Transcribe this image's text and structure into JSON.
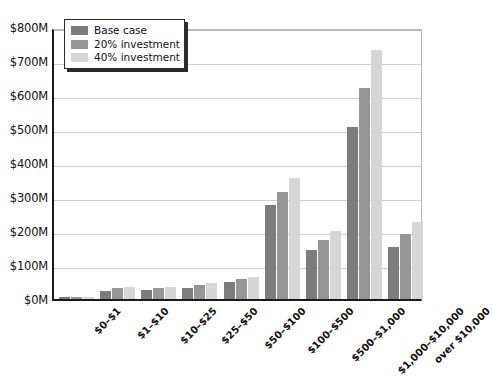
{
  "chart_data": {
    "type": "bar",
    "title": "",
    "xlabel": "",
    "ylabel": "",
    "ylim": [
      0,
      800
    ],
    "yunit": "M",
    "grid": true,
    "legend_position": "top-left",
    "ytick_labels": [
      "$800M",
      "$700M",
      "$600M",
      "$500M",
      "$400M",
      "$300M",
      "$200M",
      "$100M",
      "$0M"
    ],
    "ytick_values": [
      800,
      700,
      600,
      500,
      400,
      300,
      200,
      100,
      0
    ],
    "categories": [
      "$0–$1",
      "$1–$10",
      "$10–$25",
      "$25–$50",
      "$50–$100",
      "$100–$500",
      "$500–$1,000",
      "$1,000–$10,000",
      "over $10,000"
    ],
    "series": [
      {
        "name": "Base case",
        "color": "#7c7c7c",
        "values": [
          5,
          25,
          27,
          33,
          50,
          276,
          145,
          506,
          153
        ]
      },
      {
        "name": "20% investment",
        "color": "#969696",
        "values": [
          6,
          31,
          32,
          40,
          58,
          315,
          173,
          620,
          190
        ]
      },
      {
        "name": "40% investment",
        "color": "#d6d6d6",
        "values": [
          6,
          35,
          35,
          47,
          66,
          355,
          200,
          733,
          227
        ]
      }
    ]
  },
  "legend": {
    "entries": [
      {
        "label": "Base case",
        "color": "#7c7c7c"
      },
      {
        "label": "20% investment",
        "color": "#969696"
      },
      {
        "label": "40% investment",
        "color": "#d6d6d6"
      }
    ]
  }
}
